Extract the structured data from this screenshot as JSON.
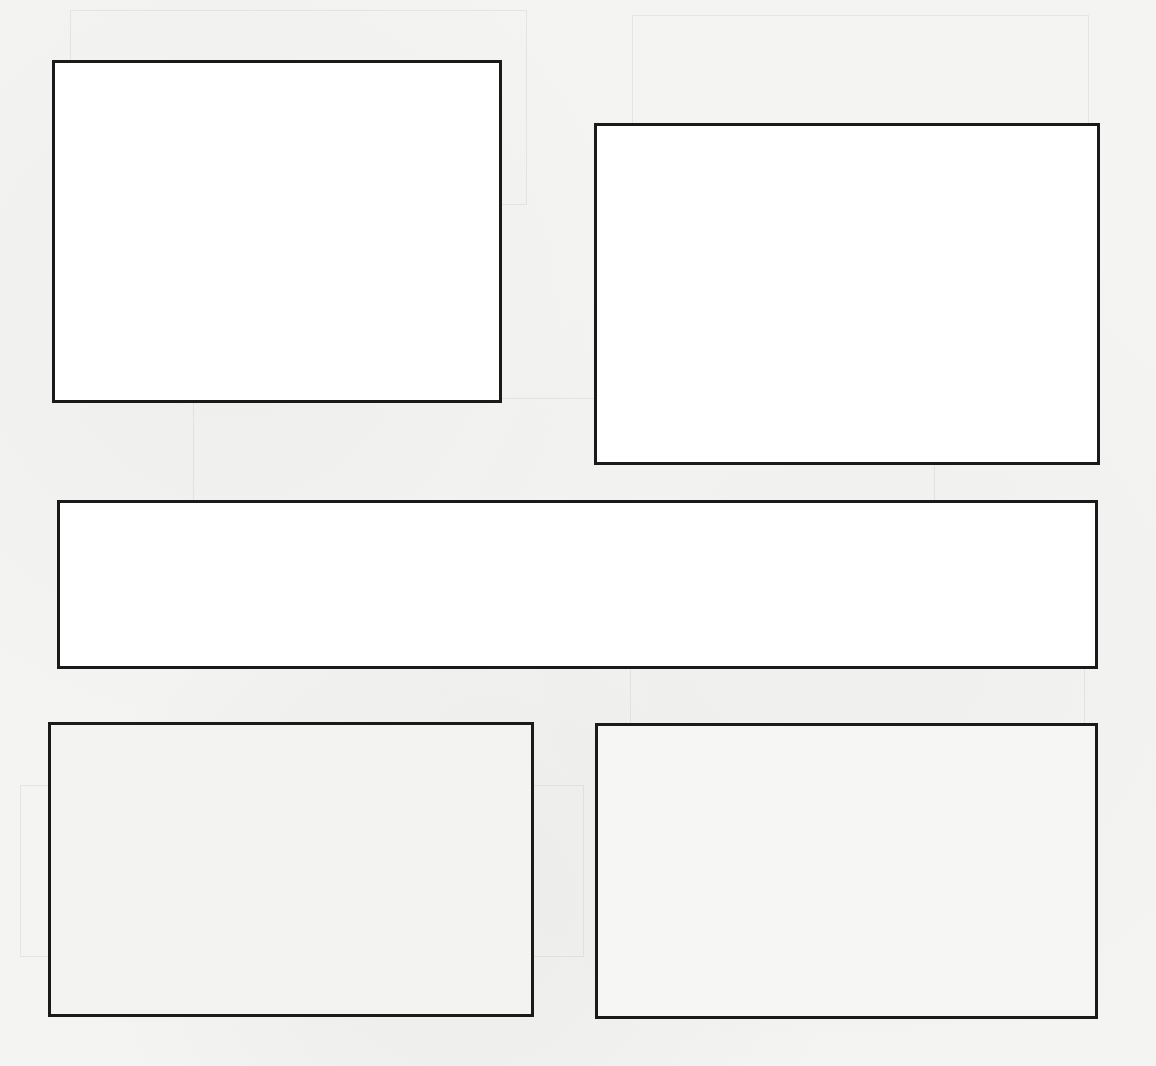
{
  "page": {
    "background": "#f4f4f3",
    "border_color": "#1a1a1a",
    "boxes": [
      {
        "id": "box-1",
        "x": 52,
        "y": 60,
        "w": 450,
        "h": 343,
        "fill": "#ffffff"
      },
      {
        "id": "box-2",
        "x": 594,
        "y": 123,
        "w": 506,
        "h": 342,
        "fill": "#ffffff"
      },
      {
        "id": "box-3",
        "x": 57,
        "y": 500,
        "w": 1041,
        "h": 169,
        "fill": "#ffffff"
      },
      {
        "id": "box-4",
        "x": 48,
        "y": 722,
        "w": 486,
        "h": 295,
        "fill": "#f3f3f2"
      },
      {
        "id": "box-5",
        "x": 595,
        "y": 723,
        "w": 503,
        "h": 296,
        "fill": "#f6f6f5"
      }
    ],
    "ghost_lines": [
      {
        "x": 70,
        "y": 10,
        "w": 455,
        "h": 193
      },
      {
        "x": 632,
        "y": 15,
        "w": 455,
        "h": 255
      },
      {
        "x": 193,
        "y": 398,
        "w": 740,
        "h": 170
      },
      {
        "x": 20,
        "y": 785,
        "w": 562,
        "h": 170
      },
      {
        "x": 630,
        "y": 640,
        "w": 453,
        "h": 338
      }
    ]
  }
}
